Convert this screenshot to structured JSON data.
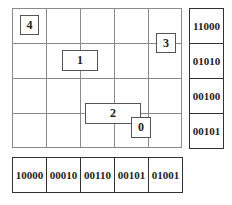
{
  "grid": {
    "cols": 5,
    "rows": 4
  },
  "boxes": [
    {
      "label": "4"
    },
    {
      "label": "1"
    },
    {
      "label": "3"
    },
    {
      "label": "2"
    },
    {
      "label": "0"
    }
  ],
  "right_column": [
    "11000",
    "01010",
    "00100",
    "00101"
  ],
  "bottom_row": [
    "10000",
    "00010",
    "00110",
    "00101",
    "01001"
  ]
}
